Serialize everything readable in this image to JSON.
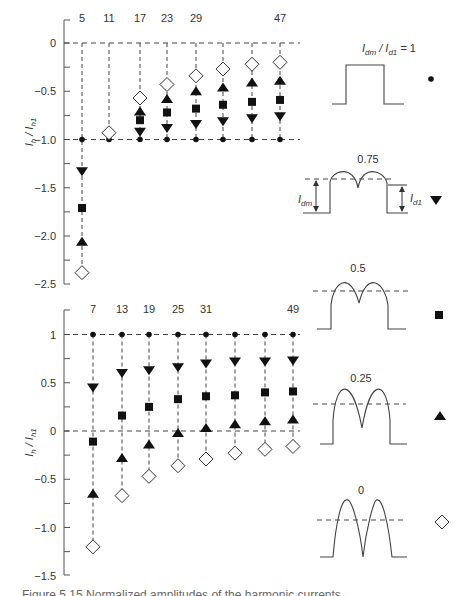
{
  "chart_data": [
    {
      "type": "scatter",
      "title": "",
      "ylabel": "I_h / I_h1",
      "xlabel": "",
      "ylim": [
        -2.5,
        0.2
      ],
      "yticks": [
        "0",
        "-0.5",
        "-1.0",
        "-1.5",
        "-2.0",
        "-2.5"
      ],
      "categories": [
        "5",
        "11",
        "17",
        "23",
        "29",
        "35",
        "41",
        "47"
      ],
      "column_labels_shown": [
        "5",
        "11",
        "17",
        "23",
        "29",
        "47"
      ],
      "series": [
        {
          "name": "Idm/Id1 = 1",
          "marker": "circle",
          "values": [
            -1.0,
            -1.0,
            -1.0,
            -1.0,
            -1.0,
            -1.0,
            -1.0,
            -1.0
          ]
        },
        {
          "name": "Idm/Id1 = 0.75",
          "marker": "triangle-down",
          "values": [
            -1.33,
            null,
            -0.92,
            -0.88,
            -0.84,
            -0.81,
            -0.78,
            -0.76
          ]
        },
        {
          "name": "Idm/Id1 = 0.5",
          "marker": "square",
          "values": [
            -1.71,
            null,
            -0.8,
            -0.72,
            -0.68,
            -0.64,
            -0.61,
            -0.59
          ]
        },
        {
          "name": "Idm/Id1 = 0.25",
          "marker": "triangle-up",
          "values": [
            -2.06,
            null,
            -0.71,
            -0.58,
            -0.5,
            -0.46,
            -0.41,
            -0.39
          ]
        },
        {
          "name": "Idm/Id1 = 0",
          "marker": "diamond-open",
          "values": [
            -2.38,
            -0.93,
            -0.57,
            -0.43,
            -0.34,
            -0.27,
            -0.22,
            -0.2
          ]
        }
      ],
      "reference_lines": [
        0,
        -1.0
      ],
      "grid": false
    },
    {
      "type": "scatter",
      "title": "",
      "ylabel": "I_h / I_h1",
      "xlabel": "",
      "ylim": [
        -1.5,
        1.2
      ],
      "yticks": [
        "1",
        "0.5",
        "0",
        "-0.5",
        "-1.0",
        "-1.5"
      ],
      "categories": [
        "7",
        "13",
        "19",
        "25",
        "31",
        "37",
        "43",
        "49"
      ],
      "column_labels_shown": [
        "7",
        "13",
        "19",
        "25",
        "31",
        "49"
      ],
      "series": [
        {
          "name": "Idm/Id1 = 1",
          "marker": "circle",
          "values": [
            1.0,
            1.0,
            1.0,
            1.0,
            1.0,
            1.0,
            1.0,
            1.0
          ]
        },
        {
          "name": "Idm/Id1 = 0.75",
          "marker": "triangle-down",
          "values": [
            0.45,
            0.6,
            0.63,
            0.66,
            0.7,
            0.72,
            0.72,
            0.73
          ]
        },
        {
          "name": "Idm/Id1 = 0.5",
          "marker": "square",
          "values": [
            -0.11,
            0.16,
            0.25,
            0.33,
            0.36,
            0.37,
            0.4,
            0.41
          ]
        },
        {
          "name": "Idm/Id1 = 0.25",
          "marker": "triangle-up",
          "values": [
            -0.65,
            -0.28,
            -0.14,
            -0.02,
            0.03,
            0.07,
            0.1,
            0.12
          ]
        },
        {
          "name": "Idm/Id1 = 0",
          "marker": "diamond-open",
          "values": [
            -1.2,
            -0.67,
            -0.47,
            -0.36,
            -0.29,
            -0.23,
            -0.19,
            -0.16
          ]
        }
      ],
      "reference_lines": [
        1,
        0
      ],
      "grid": false
    }
  ],
  "legend": {
    "title_prefix": "Idm / Id1 = 1",
    "items": [
      {
        "label": "Idm / Id1 = 1",
        "value": "1",
        "marker": "circle"
      },
      {
        "label": "0.75",
        "value": "0.75",
        "marker": "triangle-down"
      },
      {
        "label": "0.5",
        "value": "0.5",
        "marker": "square"
      },
      {
        "label": "0.25",
        "value": "0.25",
        "marker": "triangle-up"
      },
      {
        "label": "0",
        "value": "0",
        "marker": "diamond-open"
      }
    ],
    "annotations": {
      "idm": "Idm",
      "id1": "Id1"
    }
  },
  "axis_label": "Ih / Ih1",
  "caption": "Figure 5.15  Normalized amplitudes of the harmonic currents"
}
